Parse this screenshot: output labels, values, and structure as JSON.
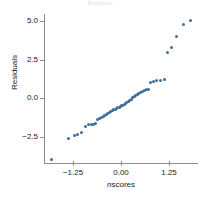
{
  "chart": {
    "title": "Residuals",
    "xlabel_italic": "n",
    "xlabel_rest": "scores",
    "ylabel": "Residuals"
  },
  "chart_data": {
    "type": "scatter",
    "title": "Residuals",
    "xlabel": "nscores",
    "ylabel": "Residuals",
    "grid": false,
    "legend": null,
    "xlim": [
      -2.0,
      2.0
    ],
    "ylim": [
      -4.2,
      5.6
    ],
    "xticks": [
      -1.25,
      0.0,
      1.25
    ],
    "xticklabels": [
      "-1.25",
      "0.00",
      "1.25"
    ],
    "yticks": [
      -2.5,
      0.0,
      2.5,
      5.0
    ],
    "yticklabels": [
      "-2.5",
      "0.0",
      "2.5",
      "5.0"
    ],
    "marker": "circle",
    "marker_color": "#3d6e9e",
    "marker_size": 3,
    "points": [
      [
        -1.8,
        -3.95
      ],
      [
        -1.36,
        -2.62
      ],
      [
        -1.2,
        -2.42
      ],
      [
        -1.12,
        -2.32
      ],
      [
        -1.02,
        -2.22
      ],
      [
        -0.92,
        -1.8
      ],
      [
        -0.84,
        -1.72
      ],
      [
        -0.77,
        -1.7
      ],
      [
        -0.71,
        -1.68
      ],
      [
        -0.65,
        -1.66
      ],
      [
        -0.6,
        -1.4
      ],
      [
        -0.55,
        -1.32
      ],
      [
        -0.5,
        -1.22
      ],
      [
        -0.46,
        -1.18
      ],
      [
        -0.42,
        -1.12
      ],
      [
        -0.38,
        -1.02
      ],
      [
        -0.34,
        -0.98
      ],
      [
        -0.3,
        -0.92
      ],
      [
        -0.26,
        -0.88
      ],
      [
        -0.22,
        -0.8
      ],
      [
        -0.19,
        -0.74
      ],
      [
        -0.15,
        -0.7
      ],
      [
        -0.12,
        -0.66
      ],
      [
        -0.08,
        -0.62
      ],
      [
        -0.05,
        -0.58
      ],
      [
        -0.02,
        -0.54
      ],
      [
        0.02,
        -0.5
      ],
      [
        0.05,
        -0.44
      ],
      [
        0.08,
        -0.4
      ],
      [
        0.12,
        -0.34
      ],
      [
        0.15,
        -0.28
      ],
      [
        0.19,
        -0.22
      ],
      [
        0.22,
        -0.14
      ],
      [
        0.26,
        -0.08
      ],
      [
        0.3,
        0.02
      ],
      [
        0.34,
        0.1
      ],
      [
        0.38,
        0.18
      ],
      [
        0.42,
        0.26
      ],
      [
        0.46,
        0.34
      ],
      [
        0.5,
        0.38
      ],
      [
        0.55,
        0.44
      ],
      [
        0.6,
        0.5
      ],
      [
        0.65,
        0.54
      ],
      [
        0.71,
        0.6
      ],
      [
        0.77,
        1.02
      ],
      [
        0.84,
        1.1
      ],
      [
        0.92,
        1.14
      ],
      [
        1.02,
        1.18
      ],
      [
        1.12,
        1.2
      ],
      [
        1.2,
        2.98
      ],
      [
        1.3,
        3.32
      ],
      [
        1.45,
        4.02
      ],
      [
        1.62,
        4.82
      ],
      [
        1.8,
        5.08
      ]
    ]
  }
}
